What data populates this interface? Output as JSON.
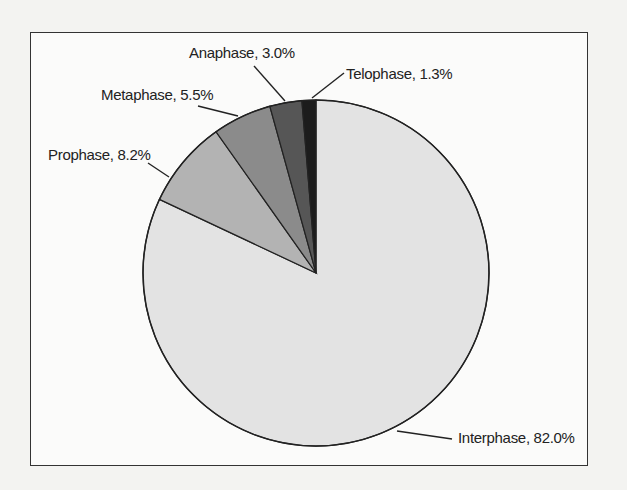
{
  "chart_data": {
    "type": "pie",
    "title": "",
    "start_angle_deg": 0,
    "direction": "clockwise",
    "slices": [
      {
        "label": "Interphase",
        "value": 82.0,
        "display": "Interphase, 82.0%",
        "color": "#e3e3e3"
      },
      {
        "label": "Prophase",
        "value": 8.2,
        "display": "Prophase, 8.2%",
        "color": "#b3b3b3"
      },
      {
        "label": "Metaphase",
        "value": 5.5,
        "display": "Metaphase, 5.5%",
        "color": "#8b8b8b"
      },
      {
        "label": "Anaphase",
        "value": 3.0,
        "display": "Anaphase, 3.0%",
        "color": "#565656"
      },
      {
        "label": "Telophase",
        "value": 1.3,
        "display": "Telophase, 1.3%",
        "color": "#1c1c1c"
      }
    ],
    "categories": [
      "Interphase",
      "Prophase",
      "Metaphase",
      "Anaphase",
      "Telophase"
    ],
    "values": [
      82.0,
      8.2,
      5.5,
      3.0,
      1.3
    ],
    "units": "%",
    "legend": "none (labels with leader lines)"
  }
}
